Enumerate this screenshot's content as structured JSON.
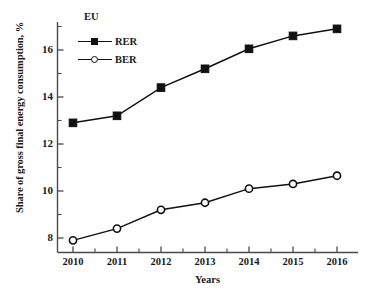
{
  "chart_data": {
    "type": "line",
    "title": "",
    "legend_title": "EU",
    "legend_position": "top-left-inside",
    "xlabel": "Years",
    "ylabel": "Share of gross final energy consumption, %",
    "categories": [
      "2010",
      "2011",
      "2012",
      "2013",
      "2014",
      "2015",
      "2016"
    ],
    "x": [
      2010,
      2011,
      2012,
      2013,
      2014,
      2015,
      2016
    ],
    "xlim": [
      2009.5,
      2016.8
    ],
    "ylim": [
      7.3,
      17.4
    ],
    "ytick_labels": [
      "8",
      "10",
      "12",
      "14",
      "16"
    ],
    "ytick_values": [
      8,
      10,
      12,
      14,
      16
    ],
    "yminor_ticks": [
      9,
      11,
      13,
      15,
      17
    ],
    "grid": false,
    "series": [
      {
        "name": "RER",
        "marker": "filled-square",
        "color": "#111111",
        "values": [
          12.9,
          13.2,
          14.4,
          15.2,
          16.05,
          16.6,
          16.9
        ]
      },
      {
        "name": "BER",
        "marker": "open-circle",
        "color": "#111111",
        "values": [
          7.9,
          8.4,
          9.2,
          9.5,
          10.1,
          10.3,
          10.65
        ]
      }
    ]
  },
  "axis": {
    "y_title": "Share of gross final energy consumption, %",
    "x_title": "Years",
    "y_ticks": [
      "8",
      "10",
      "12",
      "14",
      "16"
    ],
    "x_ticks": [
      "2010",
      "2011",
      "2012",
      "2013",
      "2014",
      "2015",
      "2016"
    ]
  },
  "legend": {
    "title": "EU",
    "entries": [
      {
        "label": "RER",
        "marker": "filled-square-icon"
      },
      {
        "label": "BER",
        "marker": "open-circle-icon"
      }
    ]
  },
  "colors": {
    "line": "#111111",
    "axis": "#444444",
    "text": "#1a1a1a",
    "background": "#ffffff"
  }
}
